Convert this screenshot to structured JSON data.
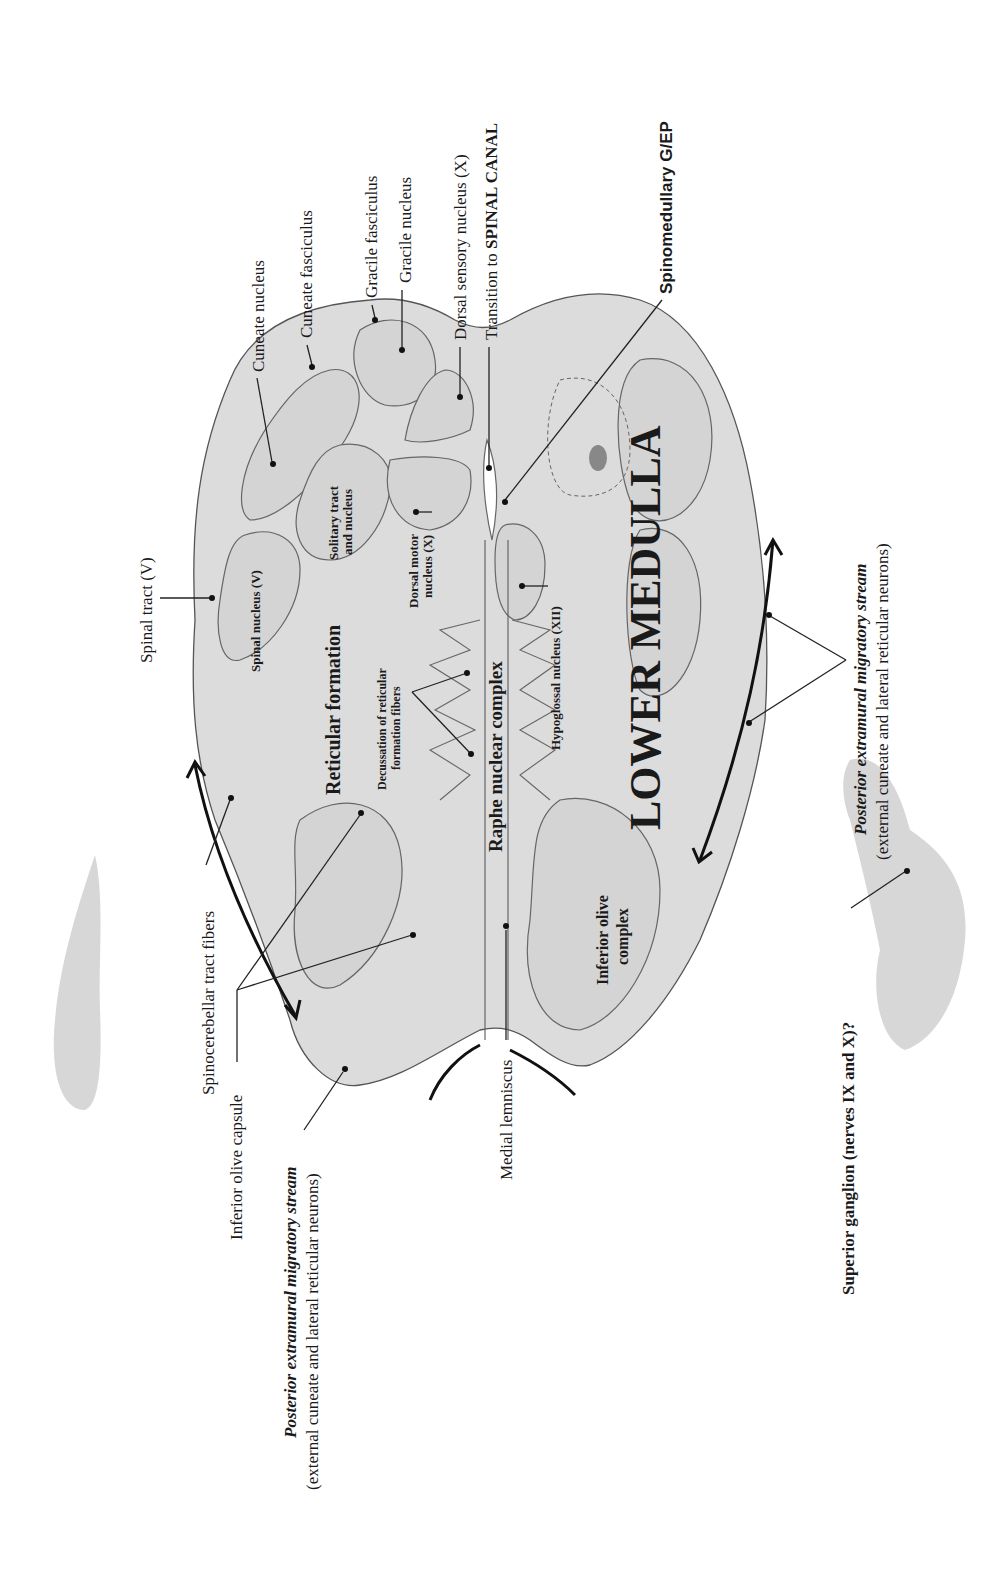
{
  "figure": {
    "title": "LOWER MEDULLA",
    "orientation": "rotated -90deg (text reads bottom-to-top)",
    "labels": {
      "cuneate_nucleus": "Cuneate nucleus",
      "cuneate_fasciculus": "Cuneate fasciculus",
      "gracile_fasciculus": "Gracile fasciculus",
      "gracile_nucleus": "Gracile nucleus",
      "dorsal_sensory_nucleus": "Dorsal sensory nucleus (X)",
      "transition_prefix": "Transition to ",
      "transition_bold": "SPINAL CANAL",
      "spinomedullary": "Spinomedullary G/EP",
      "spinal_tract": "Spinal tract (V)",
      "spinal_nucleus": "Spinal nucleus (V)",
      "solitary_line1": "Solitary tract",
      "solitary_line2": "and nucleus",
      "dorsal_motor_line1": "Dorsal motor",
      "dorsal_motor_line2": "nucleus (X)",
      "reticular_formation": "Reticular formation",
      "decussation_line1": "Decussation of reticular",
      "decussation_line2": "formation fibers",
      "raphe": "Raphe nuclear complex",
      "hypoglossal": "Hypoglossal nucleus (XII)",
      "inferior_olive_line1": "Inferior olive",
      "inferior_olive_line2": "complex",
      "spinocerebellar": "Spinocerebellar tract fibers",
      "inferior_olive_capsule": "Inferior olive capsule",
      "medial_lemniscus": "Medial lemniscus",
      "pems_left_bold": "Posterior extramural migratory stream",
      "pems_left_sub": "(external cuneate and lateral reticular neurons)",
      "pems_right_bold": "Posterior extramural migratory stream",
      "pems_right_sub": "(external cuneate and lateral reticular neurons)",
      "superior_ganglion": "Superior ganglion (nerves IX and X)?"
    }
  }
}
